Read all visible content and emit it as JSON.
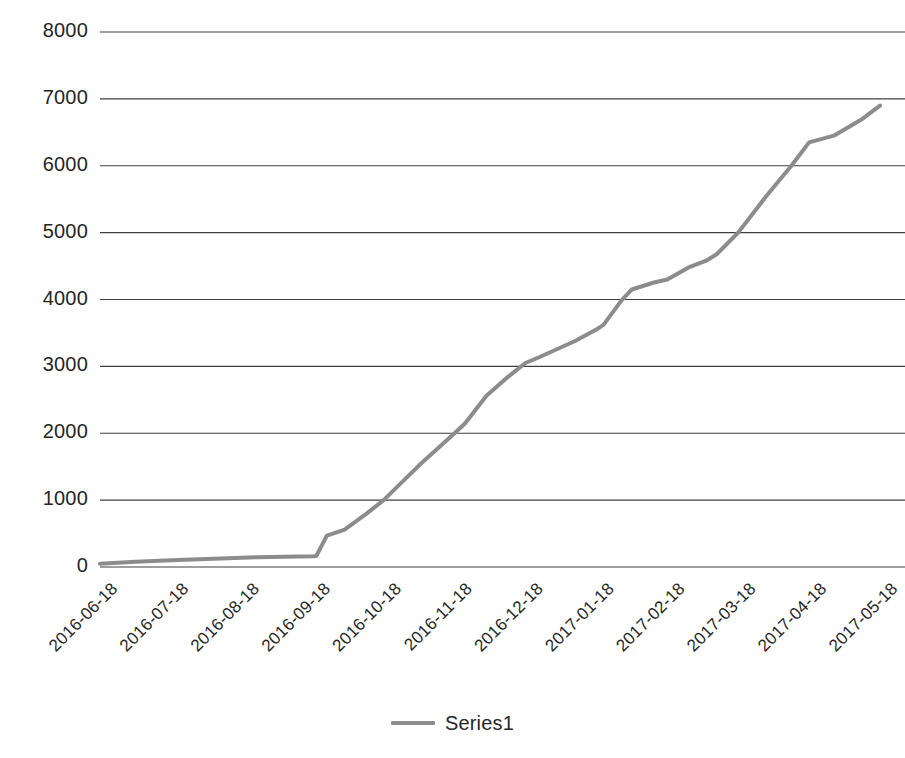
{
  "chart_data": {
    "type": "line",
    "title": "",
    "xlabel": "",
    "ylabel": "",
    "grid": true,
    "legend_position": "bottom",
    "ylim": [
      0,
      8000
    ],
    "yticks": [
      0,
      1000,
      2000,
      3000,
      4000,
      5000,
      6000,
      7000,
      8000
    ],
    "ytick_labels": [
      "0",
      "1000",
      "2000",
      "3000",
      "4000",
      "5000",
      "6000",
      "7000",
      "8000"
    ],
    "categories": [
      "2016-06-18",
      "2016-07-18",
      "2016-08-18",
      "2016-09-18",
      "2016-10-18",
      "2016-11-18",
      "2016-12-18",
      "2017-01-18",
      "2017-02-18",
      "2017-03-18",
      "2017-04-18",
      "2017-05-18"
    ],
    "series": [
      {
        "name": "Series1",
        "color": "#8c8c8c",
        "values": [
          50,
          100,
          140,
          160,
          1000,
          2000,
          3050,
          3550,
          4250,
          5000,
          6350,
          6900
        ],
        "points": [
          {
            "x": 0.0,
            "y": 50
          },
          {
            "x": 0.5,
            "y": 80
          },
          {
            "x": 1.0,
            "y": 100
          },
          {
            "x": 1.6,
            "y": 125
          },
          {
            "x": 2.2,
            "y": 145
          },
          {
            "x": 3.0,
            "y": 160
          },
          {
            "x": 3.05,
            "y": 165
          },
          {
            "x": 3.2,
            "y": 470
          },
          {
            "x": 3.45,
            "y": 560
          },
          {
            "x": 3.75,
            "y": 790
          },
          {
            "x": 4.0,
            "y": 1000
          },
          {
            "x": 4.5,
            "y": 1520
          },
          {
            "x": 5.0,
            "y": 2000
          },
          {
            "x": 5.15,
            "y": 2150
          },
          {
            "x": 5.45,
            "y": 2560
          },
          {
            "x": 5.75,
            "y": 2840
          },
          {
            "x": 6.0,
            "y": 3050
          },
          {
            "x": 6.2,
            "y": 3140
          },
          {
            "x": 6.7,
            "y": 3380
          },
          {
            "x": 7.0,
            "y": 3550
          },
          {
            "x": 7.1,
            "y": 3620
          },
          {
            "x": 7.35,
            "y": 3980
          },
          {
            "x": 7.5,
            "y": 4150
          },
          {
            "x": 7.8,
            "y": 4250
          },
          {
            "x": 8.0,
            "y": 4300
          },
          {
            "x": 8.3,
            "y": 4480
          },
          {
            "x": 8.55,
            "y": 4580
          },
          {
            "x": 8.7,
            "y": 4680
          },
          {
            "x": 9.0,
            "y": 5000
          },
          {
            "x": 9.4,
            "y": 5550
          },
          {
            "x": 9.75,
            "y": 6000
          },
          {
            "x": 10.0,
            "y": 6350
          },
          {
            "x": 10.35,
            "y": 6450
          },
          {
            "x": 10.75,
            "y": 6700
          },
          {
            "x": 11.0,
            "y": 6900
          }
        ]
      }
    ]
  },
  "legend": {
    "items": [
      {
        "label": "Series1",
        "color": "#8c8c8c"
      }
    ]
  },
  "axes": {
    "gridline_color": "#3f3f3f",
    "tick_label_color": "#262626"
  },
  "plot_geometry": {
    "left": 100,
    "right": 880,
    "top": 32,
    "bottom": 567
  }
}
